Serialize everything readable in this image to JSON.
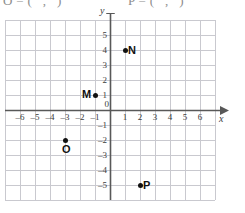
{
  "worksheet": {
    "prompts": [
      {
        "id": "o-prompt",
        "text": "O = (   ,   )"
      },
      {
        "id": "p-prompt",
        "text": "P = (   ,   )"
      }
    ]
  },
  "chart_data": {
    "type": "scatter",
    "title": "",
    "xlabel": "x",
    "ylabel": "y",
    "grid": true,
    "legend": "none",
    "xlim": [
      -7,
      7
    ],
    "ylim": [
      -6,
      6
    ],
    "x_ticks": [
      -6,
      -5,
      -4,
      -3,
      -2,
      -1,
      0,
      1,
      2,
      3,
      4,
      5,
      6
    ],
    "y_ticks": [
      5,
      4,
      3,
      2,
      1,
      0,
      -1,
      -2,
      -3,
      -4,
      -5
    ],
    "x_tick_labels": [
      "–6",
      "–5",
      "–4",
      "–3",
      "–2",
      "–1",
      "0",
      "1",
      "2",
      "3",
      "4",
      "5",
      "6"
    ],
    "y_tick_labels": [
      "5",
      "4",
      "3",
      "2",
      "1",
      "0",
      "–1",
      "–2",
      "–3",
      "–4",
      "–5"
    ],
    "origin_label": "0",
    "points": [
      {
        "name": "M",
        "x": -1,
        "y": 1,
        "label": "M",
        "label_pos": "left"
      },
      {
        "name": "N",
        "x": 1,
        "y": 4,
        "label": "N",
        "label_pos": "right"
      },
      {
        "name": "O",
        "x": -3,
        "y": -2,
        "label": "O",
        "label_pos": "below"
      },
      {
        "name": "P",
        "x": 2,
        "y": -5,
        "label": "P",
        "label_pos": "right"
      }
    ]
  },
  "style": {
    "grid_color": "#c9c9cf",
    "axis_color": "#585858",
    "point_color": "#111111",
    "tick_color": "#3b3b3b",
    "background": "#ffffff"
  }
}
